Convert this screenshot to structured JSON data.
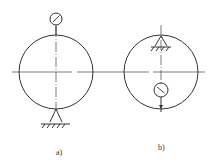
{
  "diagram": {
    "type": "technical-drawing",
    "colors": {
      "stroke": "#333333",
      "background": "#ffffff"
    },
    "figures": [
      {
        "id": "a",
        "label": "a)",
        "circle": {
          "cx": 56,
          "cy": 72,
          "r": 37
        },
        "dial_indicator": {
          "position": "outside-top",
          "icon": "dial-gauge-icon"
        },
        "support": {
          "position": "outside-bottom",
          "icon": "fixed-support-icon"
        }
      },
      {
        "id": "b",
        "label": "b)",
        "circle": {
          "cx": 161,
          "cy": 72,
          "r": 37
        },
        "dial_indicator": {
          "position": "inside-bottom",
          "icon": "dial-gauge-icon"
        },
        "support": {
          "position": "inside-top",
          "icon": "fixed-support-icon"
        }
      }
    ]
  }
}
